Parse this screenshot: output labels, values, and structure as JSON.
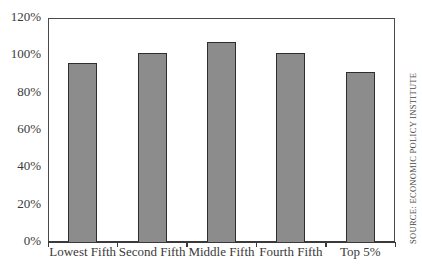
{
  "chart_data": {
    "type": "bar",
    "title": "",
    "xlabel": "",
    "ylabel": "",
    "categories": [
      "Lowest Fifth",
      "Second Fifth",
      "Middle Fifth",
      "Fourth Fifth",
      "Top 5%"
    ],
    "values": [
      96,
      101,
      107,
      101,
      91
    ],
    "value_unit": "%",
    "ylim": [
      0,
      120
    ],
    "y_ticks": [
      "0%",
      "20%",
      "40%",
      "60%",
      "80%",
      "100%",
      "120%"
    ],
    "y_tick_values": [
      0,
      20,
      40,
      60,
      80,
      100,
      120
    ],
    "grid": false,
    "legend": null,
    "bar_color": "#8c8c8c",
    "bar_edge_color": "#2e2e2e",
    "source_note": "SOURCE: ECONOMIC POLICY INSTITUTE"
  }
}
